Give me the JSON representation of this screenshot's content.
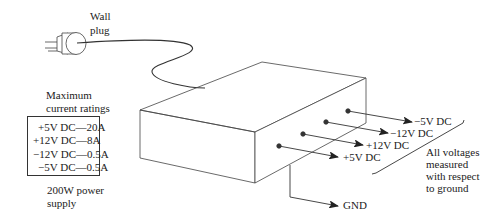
{
  "plug_label": [
    "Wall",
    "plug"
  ],
  "ratings_title": [
    "Maximum",
    "current ratings"
  ],
  "ratings": [
    {
      "voltage": "+5V DC",
      "current": "20A",
      "text": "+5V DC—20A"
    },
    {
      "voltage": "+12V DC",
      "current": "8A",
      "text": "+12V DC—8A"
    },
    {
      "voltage": "−12V DC",
      "current": "0.5A",
      "text": "−12V DC—0.5A"
    },
    {
      "voltage": "−5V DC",
      "current": "0.5A",
      "text": "−5V DC—0.5A"
    }
  ],
  "supply_label": [
    "200W power",
    "supply"
  ],
  "outputs": [
    {
      "label": "−5V DC"
    },
    {
      "label": "−12V DC"
    },
    {
      "label": "+12V DC"
    },
    {
      "label": "+5V DC"
    }
  ],
  "ground_label": "GND",
  "note": [
    "All voltages",
    "measured",
    "with respect",
    "to ground"
  ],
  "colors": {
    "line": "#333333",
    "text": "#222222",
    "background": "#ffffff"
  }
}
